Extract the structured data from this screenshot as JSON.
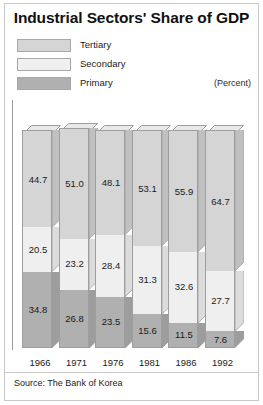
{
  "chart": {
    "title": "Industrial Sectors' Share of GDP",
    "unit_label": "(Percent)",
    "source": "Source: The Bank of Korea"
  },
  "legend": {
    "items": [
      {
        "label": "Tertiary",
        "color": "#d5d5d5"
      },
      {
        "label": "Secondary",
        "color": "#efefef"
      },
      {
        "label": "Primary",
        "color": "#b0b0b0"
      }
    ]
  },
  "chart_data": {
    "type": "bar",
    "subtype": "stacked-column-3d",
    "title": "Industrial Sectors' Share of GDP",
    "xlabel": "",
    "ylabel": "",
    "unit": "Percent",
    "ylim": [
      0,
      100
    ],
    "grid": false,
    "legend_position": "top-left",
    "categories": [
      "1966",
      "1971",
      "1976",
      "1981",
      "1986",
      "1992"
    ],
    "series": [
      {
        "name": "Primary",
        "color": "#b0b0b0",
        "values": [
          34.8,
          26.8,
          23.5,
          15.6,
          11.5,
          7.6
        ]
      },
      {
        "name": "Secondary",
        "color": "#efefef",
        "values": [
          20.5,
          23.2,
          28.4,
          31.3,
          32.6,
          27.7
        ]
      },
      {
        "name": "Tertiary",
        "color": "#d5d5d5",
        "values": [
          44.7,
          51.0,
          48.1,
          53.1,
          55.9,
          64.7
        ]
      }
    ],
    "source": "Source: The Bank of Korea",
    "annotations": [
      "(Percent)"
    ]
  },
  "bars": [
    {
      "year": "1966",
      "primary": "34.8",
      "secondary": "20.5",
      "tertiary": "44.7",
      "primary_v": 34.8,
      "secondary_v": 20.5,
      "tertiary_v": 44.7
    },
    {
      "year": "1971",
      "primary": "26.8",
      "secondary": "23.2",
      "tertiary": "51.0",
      "primary_v": 26.8,
      "secondary_v": 23.2,
      "tertiary_v": 51.0
    },
    {
      "year": "1976",
      "primary": "23.5",
      "secondary": "28.4",
      "tertiary": "48.1",
      "primary_v": 23.5,
      "secondary_v": 28.4,
      "tertiary_v": 48.1
    },
    {
      "year": "1981",
      "primary": "15.6",
      "secondary": "31.3",
      "tertiary": "53.1",
      "primary_v": 15.6,
      "secondary_v": 31.3,
      "tertiary_v": 53.1
    },
    {
      "year": "1986",
      "primary": "11.5",
      "secondary": "32.6",
      "tertiary": "55.9",
      "primary_v": 11.5,
      "secondary_v": 32.6,
      "tertiary_v": 55.9
    },
    {
      "year": "1992",
      "primary": "7.6",
      "secondary": "27.7",
      "tertiary": "64.7",
      "primary_v": 7.6,
      "secondary_v": 27.7,
      "tertiary_v": 64.7
    }
  ]
}
